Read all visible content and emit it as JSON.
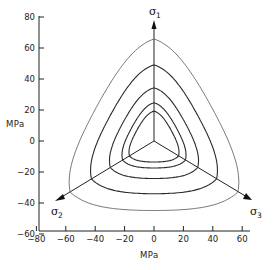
{
  "chart_data": {
    "type": "line",
    "title": "",
    "xlabel": "MPa",
    "ylabel": "MPa",
    "xlim": [
      -80,
      70
    ],
    "ylim": [
      -60,
      80
    ],
    "x_ticks": [
      "-80",
      "-60",
      "-40",
      "-20",
      "0",
      "20",
      "40",
      "60"
    ],
    "y_ticks": [
      "80",
      "60",
      "40",
      "20",
      "0",
      "-20",
      "-40",
      "-60"
    ],
    "grid": false,
    "axes_labels": {
      "sigma1": "σ1",
      "sigma2": "σ2",
      "sigma3": "σ3"
    },
    "series": [
      {
        "name": "contour-1",
        "apex_on_sigma1_MPa": 62,
        "bottom_MPa": -46
      },
      {
        "name": "contour-2",
        "apex_on_sigma1_MPa": 46,
        "bottom_MPa": -35
      },
      {
        "name": "contour-3",
        "apex_on_sigma1_MPa": 32,
        "bottom_MPa": -25
      },
      {
        "name": "contour-4",
        "apex_on_sigma1_MPa": 23,
        "bottom_MPa": -18
      },
      {
        "name": "contour-5",
        "apex_on_sigma1_MPa": 18,
        "bottom_MPa": -14
      }
    ]
  },
  "labels": {
    "y_unit": "MPa",
    "x_unit": "MPa",
    "sigma": "σ",
    "s1": "1",
    "s2": "2",
    "s3": "3"
  }
}
